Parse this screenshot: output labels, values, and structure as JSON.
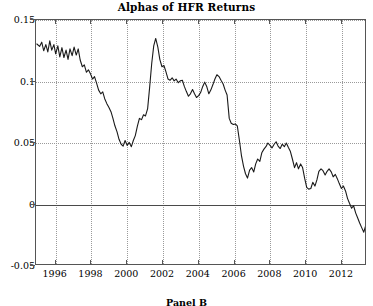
{
  "chart_data": {
    "type": "line",
    "title": "Alphas of HFR Returns",
    "xlabel": "",
    "ylabel": "",
    "xlim": [
      1994.9,
      2013.4
    ],
    "ylim": [
      -0.05,
      0.15
    ],
    "grid": true,
    "legend": null,
    "xticks": [
      1996,
      1998,
      2000,
      2002,
      2004,
      2006,
      2008,
      2010,
      2012
    ],
    "xtick_labels": [
      "1996",
      "1998",
      "2000",
      "2002",
      "2004",
      "2006",
      "2008",
      "2010",
      "2012"
    ],
    "yticks": [
      -0.05,
      0,
      0.05,
      0.1,
      0.15
    ],
    "ytick_labels": [
      "-0.05",
      "0",
      "0.05",
      "0.1",
      "0.15"
    ],
    "zero_line": 0,
    "line_color": "#1a1a1a",
    "grid_color": "#9a9a9a",
    "series": [
      {
        "name": "Alpha",
        "x": [
          1994.95,
          1995.1,
          1995.22,
          1995.33,
          1995.45,
          1995.56,
          1995.67,
          1995.78,
          1995.9,
          1996.0,
          1996.12,
          1996.23,
          1996.35,
          1996.46,
          1996.58,
          1996.69,
          1996.8,
          1996.92,
          1997.03,
          1997.15,
          1997.26,
          1997.37,
          1997.49,
          1997.6,
          1997.72,
          1997.83,
          1997.95,
          1998.06,
          1998.17,
          1998.29,
          1998.4,
          1998.52,
          1998.63,
          1998.74,
          1998.86,
          1998.97,
          1999.09,
          1999.2,
          1999.31,
          1999.43,
          1999.54,
          1999.66,
          1999.77,
          1999.88,
          2000.0,
          2000.11,
          2000.23,
          2000.34,
          2000.45,
          2000.57,
          2000.68,
          2000.8,
          2000.91,
          2001.02,
          2001.14,
          2001.25,
          2001.37,
          2001.48,
          2001.59,
          2001.71,
          2001.82,
          2001.94,
          2002.05,
          2002.16,
          2002.28,
          2002.39,
          2002.51,
          2002.62,
          2002.73,
          2002.85,
          2002.96,
          2003.08,
          2003.19,
          2003.3,
          2003.42,
          2003.53,
          2003.65,
          2003.76,
          2003.87,
          2003.99,
          2004.1,
          2004.22,
          2004.33,
          2004.44,
          2004.56,
          2004.67,
          2004.79,
          2004.9,
          2005.01,
          2005.13,
          2005.24,
          2005.36,
          2005.47,
          2005.58,
          2005.7,
          2005.81,
          2005.93,
          2006.04,
          2006.15,
          2006.27,
          2006.38,
          2006.5,
          2006.61,
          2006.72,
          2006.84,
          2006.95,
          2007.07,
          2007.18,
          2007.29,
          2007.41,
          2007.52,
          2007.64,
          2007.75,
          2007.86,
          2007.98,
          2008.09,
          2008.21,
          2008.32,
          2008.43,
          2008.55,
          2008.66,
          2008.78,
          2008.89,
          2009.0,
          2009.12,
          2009.23,
          2009.35,
          2009.46,
          2009.57,
          2009.69,
          2009.8,
          2009.92,
          2010.03,
          2010.14,
          2010.26,
          2010.37,
          2010.49,
          2010.6,
          2010.71,
          2010.83,
          2010.94,
          2011.06,
          2011.17,
          2011.28,
          2011.4,
          2011.51,
          2011.63,
          2011.74,
          2011.85,
          2011.97,
          2012.08,
          2012.2,
          2012.31,
          2012.42,
          2012.54,
          2012.65,
          2012.77,
          2012.88,
          2012.99,
          2013.11,
          2013.22,
          2013.33
        ],
        "y": [
          0.1305,
          0.1285,
          0.132,
          0.125,
          0.13,
          0.124,
          0.133,
          0.1255,
          0.13,
          0.1225,
          0.129,
          0.12,
          0.1275,
          0.1195,
          0.1255,
          0.118,
          0.1265,
          0.121,
          0.128,
          0.1215,
          0.1265,
          0.1175,
          0.112,
          0.1135,
          0.1075,
          0.1095,
          0.106,
          0.102,
          0.104,
          0.0985,
          0.093,
          0.09,
          0.0915,
          0.086,
          0.082,
          0.079,
          0.0755,
          0.07,
          0.064,
          0.059,
          0.053,
          0.049,
          0.0475,
          0.052,
          0.048,
          0.0505,
          0.047,
          0.052,
          0.056,
          0.064,
          0.07,
          0.069,
          0.073,
          0.072,
          0.078,
          0.095,
          0.115,
          0.129,
          0.135,
          0.128,
          0.118,
          0.112,
          0.113,
          0.108,
          0.102,
          0.101,
          0.103,
          0.1005,
          0.102,
          0.099,
          0.1005,
          0.101,
          0.096,
          0.092,
          0.088,
          0.09,
          0.0935,
          0.09,
          0.087,
          0.0885,
          0.091,
          0.096,
          0.0995,
          0.096,
          0.09,
          0.093,
          0.0975,
          0.102,
          0.1055,
          0.104,
          0.101,
          0.098,
          0.093,
          0.089,
          0.07,
          0.066,
          0.065,
          0.0655,
          0.064,
          0.052,
          0.04,
          0.031,
          0.025,
          0.0215,
          0.028,
          0.03,
          0.0265,
          0.033,
          0.037,
          0.035,
          0.042,
          0.045,
          0.047,
          0.05,
          0.048,
          0.046,
          0.049,
          0.051,
          0.0475,
          0.0455,
          0.049,
          0.047,
          0.05,
          0.0465,
          0.043,
          0.037,
          0.03,
          0.034,
          0.029,
          0.033,
          0.03,
          0.021,
          0.014,
          0.0125,
          0.013,
          0.018,
          0.015,
          0.02,
          0.027,
          0.029,
          0.0275,
          0.024,
          0.027,
          0.029,
          0.0265,
          0.0225,
          0.0245,
          0.021,
          0.017,
          0.013,
          0.015,
          0.011,
          0.005,
          0.001,
          -0.003,
          -0.001,
          -0.007,
          -0.011,
          -0.015,
          -0.019,
          -0.0225,
          -0.017
        ]
      }
    ]
  },
  "caption": {
    "text": "Panel B"
  }
}
